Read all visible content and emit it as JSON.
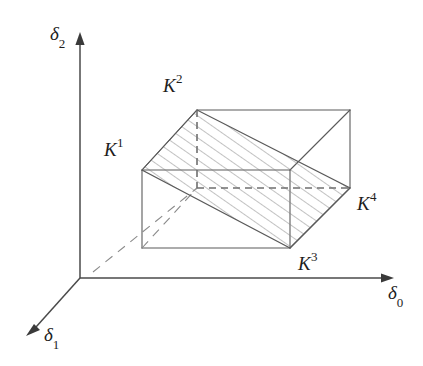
{
  "figure": {
    "kind": "3d-geometry-diagram",
    "background_color": "#ffffff",
    "line_color": "#5a5a5a",
    "hatch_color": "#7d7d7d",
    "text_color": "#1d1d1d"
  },
  "axes": [
    {
      "id": "delta0",
      "symbol": "δ",
      "subscript": "0",
      "label": "δ₀",
      "direction": "right",
      "origin": {
        "x": 80,
        "y": 278
      },
      "tip": {
        "x": 393,
        "y": 278
      },
      "label_pos": {
        "x": 388,
        "y": 282
      }
    },
    {
      "id": "delta2",
      "symbol": "δ",
      "subscript": "2",
      "label": "δ₂",
      "direction": "up",
      "origin": {
        "x": 80,
        "y": 278
      },
      "tip": {
        "x": 80,
        "y": 34
      },
      "label_pos": {
        "x": 50,
        "y": 24
      }
    },
    {
      "id": "delta1",
      "symbol": "δ",
      "subscript": "1",
      "label": "δ₁",
      "direction": "down-left",
      "origin": {
        "x": 80,
        "y": 278
      },
      "tip": {
        "x": 27,
        "y": 336
      },
      "label_pos": {
        "x": 42,
        "y": 326
      }
    }
  ],
  "vertex_labels": [
    {
      "id": "K1",
      "symbol": "K",
      "superscript": "1",
      "label": "K¹",
      "pos": {
        "x": 104,
        "y": 138
      }
    },
    {
      "id": "K2",
      "symbol": "K",
      "superscript": "2",
      "label": "K²",
      "pos": {
        "x": 163,
        "y": 74
      }
    },
    {
      "id": "K3",
      "symbol": "K",
      "superscript": "3",
      "label": "K³",
      "pos": {
        "x": 298,
        "y": 252
      }
    },
    {
      "id": "K4",
      "symbol": "K",
      "superscript": "4",
      "label": "K⁴",
      "pos": {
        "x": 357,
        "y": 192
      }
    }
  ],
  "box": {
    "description": "parallelepiped drawn in oblique projection",
    "front_face": [
      {
        "x": 142,
        "y": 170
      },
      {
        "x": 290,
        "y": 170
      },
      {
        "x": 290,
        "y": 248
      },
      {
        "x": 142,
        "y": 248
      }
    ],
    "back_face": [
      {
        "x": 197,
        "y": 110
      },
      {
        "x": 350,
        "y": 110
      },
      {
        "x": 350,
        "y": 188
      },
      {
        "x": 197,
        "y": 188
      }
    ],
    "depth_offset": {
      "dx": 55,
      "dy": -60
    },
    "hidden_edges": [
      {
        "from": {
          "x": 197,
          "y": 110
        },
        "to": {
          "x": 197,
          "y": 188
        }
      },
      {
        "from": {
          "x": 197,
          "y": 188
        },
        "to": {
          "x": 350,
          "y": 188
        }
      }
    ]
  },
  "hatched_plane": {
    "description": "shaded cutting plane K1-K2-K4-K3",
    "vertices": [
      {
        "id": "K2",
        "x": 197,
        "y": 110
      },
      {
        "id": "K4",
        "x": 350,
        "y": 188
      },
      {
        "id": "K3",
        "x": 290,
        "y": 248
      },
      {
        "id": "K1",
        "x": 142,
        "y": 170
      }
    ],
    "hatch_angle_deg": 55,
    "hatch_spacing_px": 9
  },
  "dashed_ray": {
    "description": "projection ray along delta1 direction from origin to hidden back-bottom-left vertex",
    "from": {
      "x": 93,
      "y": 272
    },
    "to": {
      "x": 197,
      "y": 188
    }
  }
}
